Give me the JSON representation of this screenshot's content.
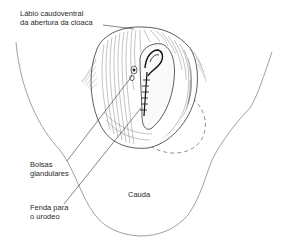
{
  "figure": {
    "stroke_color": "#555555",
    "ink_color": "#1a1a1a",
    "background": "#ffffff"
  },
  "labels": {
    "lip": {
      "line1": "Lábio caudoventral",
      "line2": "da abertura da cloaca"
    },
    "glands": {
      "line1": "Bolsas",
      "line2": "glandulares"
    },
    "tail": {
      "line1": "Cauda"
    },
    "slit": {
      "line1": "Fenda para",
      "line2": "o urodeo"
    }
  }
}
